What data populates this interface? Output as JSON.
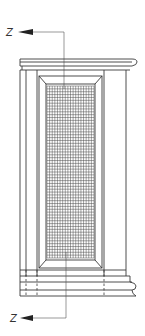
{
  "figure": {
    "type": "technical-elevation-drawing",
    "section_markers": [
      {
        "label": "Z",
        "position": "top",
        "arrow_direction": "left"
      },
      {
        "label": "Z",
        "position": "bottom",
        "arrow_direction": "left"
      }
    ],
    "grid": {
      "columns": 18,
      "rows": 60
    },
    "colors": {
      "line": "#3a3a3a",
      "background": "#ffffff"
    }
  }
}
